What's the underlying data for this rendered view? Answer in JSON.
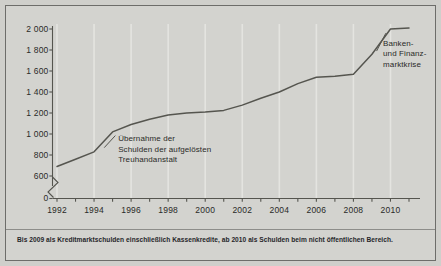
{
  "figure": {
    "background_color": "#d3d3cf",
    "border_color": "#6d6d6a",
    "line_color": "#55554f",
    "text_color": "#2a2a28"
  },
  "footnote": {
    "text": "Bis 2009 als Kreditmarktschulden einschließlich Kassenkredite, ab 2010 als Schulden beim nicht öffentlichen Bereich."
  },
  "annotations": [
    {
      "id": "treuhandanstalt",
      "lines": [
        "Übernahme der",
        "Schulden der aufgelösten",
        "Treuhandanstalt"
      ],
      "x_year": 1995.3,
      "y_value": 960
    },
    {
      "id": "finanzkrise",
      "lines": [
        "Banken-",
        "und Finanz-",
        "marktkrise"
      ],
      "x_year": 2009.6,
      "y_value": 1870
    }
  ],
  "axis_break": {
    "present": true,
    "between": [
      0,
      600
    ],
    "symbol": "zigzag"
  },
  "chart_data": {
    "type": "line",
    "title": "",
    "subtitle": "",
    "xlabel": "",
    "ylabel": "",
    "grid": true,
    "grid_axis": "x",
    "legend": false,
    "legend_position": "none",
    "xlim": [
      1991.5,
      2011.5
    ],
    "ylim": [
      0,
      2100
    ],
    "y_ticks": [
      0,
      600,
      800,
      1000,
      1200,
      1400,
      1600,
      1800,
      2000
    ],
    "y_tick_labels": [
      "0",
      "600",
      "800",
      "1 000",
      "1 200",
      "1 400",
      "1 600",
      "1 800",
      "2 000"
    ],
    "x_ticks": [
      1992,
      1993,
      1994,
      1995,
      1996,
      1997,
      1998,
      1999,
      2000,
      2001,
      2002,
      2003,
      2004,
      2005,
      2006,
      2007,
      2008,
      2009,
      2010,
      2011
    ],
    "x_tick_labels_shown": [
      "1992",
      "1994",
      "1996",
      "1998",
      "2000",
      "2002",
      "2004",
      "2006",
      "2008",
      "2010"
    ],
    "x": [
      1992,
      1993,
      1994,
      1995,
      1996,
      1997,
      1998,
      1999,
      2000,
      2001,
      2002,
      2003,
      2004,
      2005,
      2006,
      2007,
      2008,
      2009,
      2010,
      2011
    ],
    "series": [
      {
        "name": "Schulden",
        "values": [
          690,
          760,
          830,
          1020,
          1090,
          1140,
          1180,
          1200,
          1210,
          1225,
          1275,
          1340,
          1400,
          1480,
          1540,
          1550,
          1570,
          1760,
          2000,
          2010
        ]
      }
    ]
  }
}
